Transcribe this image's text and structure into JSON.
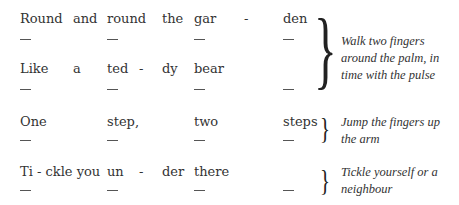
{
  "verses": [
    {
      "lines": [
        {
          "words": [
            "Round",
            "and",
            "round",
            "the",
            "gar",
            "-",
            "den"
          ]
        },
        {
          "words": [
            "Like",
            "a",
            "ted",
            "-",
            "dy",
            "bear"
          ]
        }
      ],
      "note": "Walk two fingers around the palm, in time with the pulse"
    },
    {
      "lines": [
        {
          "words": [
            "One",
            "step,",
            "two",
            "steps"
          ]
        }
      ],
      "note": "Jump the fingers up the arm"
    },
    {
      "lines": [
        {
          "words": [
            "Ti - ckle you",
            "un",
            "-",
            "der",
            "there"
          ]
        }
      ],
      "note": "Tickle yourself or a neighbour"
    }
  ],
  "beat_mark": "—",
  "brace_glyph": "}"
}
